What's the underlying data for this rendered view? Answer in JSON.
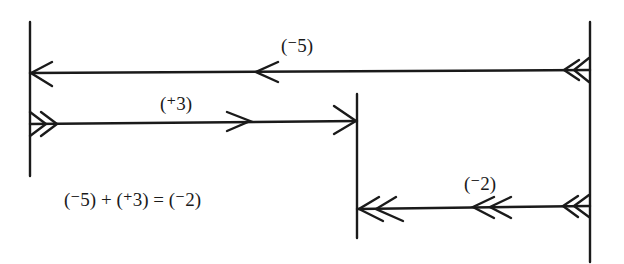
{
  "diagram": {
    "type": "number-line-vector-addition",
    "colors": {
      "ink": "#1a1a1a",
      "background": "#ffffff"
    },
    "labels": {
      "first_vector": "(⁻5)",
      "second_vector": "(⁺3)",
      "result_vector": "(⁻2)",
      "equation": "(⁻5) + (⁺3) = (⁻2)"
    },
    "vectors": [
      {
        "name": "first",
        "value": "-5",
        "direction": "left",
        "from_line": "right",
        "to_line": "left"
      },
      {
        "name": "second",
        "value": "+3",
        "direction": "right",
        "from_line": "left",
        "to_line": "middle"
      },
      {
        "name": "result",
        "value": "-2",
        "direction": "left",
        "from_line": "right",
        "to_line": "middle"
      }
    ]
  }
}
